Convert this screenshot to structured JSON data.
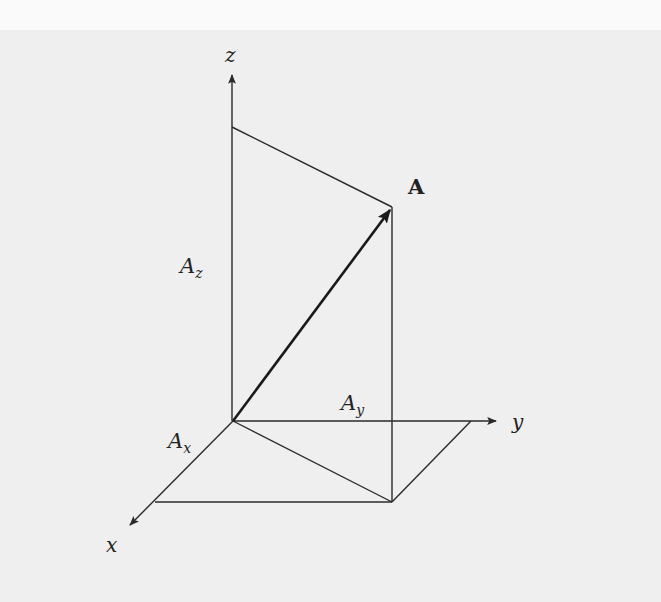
{
  "diagram": {
    "colors": {
      "background": "#efefef",
      "top_band": "#fafafa",
      "stroke": "#2a2a2a"
    },
    "axes": {
      "z": {
        "label": "z"
      },
      "y": {
        "label": "y"
      },
      "x": {
        "label": "x"
      }
    },
    "vector": {
      "label": "A"
    },
    "components": {
      "Az": {
        "base": "A",
        "sub": "z"
      },
      "Ay": {
        "base": "A",
        "sub": "y"
      },
      "Ax": {
        "base": "A",
        "sub": "x"
      }
    },
    "points": {
      "origin": [
        233,
        421
      ],
      "z_axis_tip": [
        232,
        73
      ],
      "y_axis_tip": [
        498,
        421
      ],
      "x_axis_tip": [
        128,
        527
      ],
      "z_projection": [
        232,
        127
      ],
      "vector_tip": [
        392,
        207
      ],
      "xy_projection": [
        392,
        502
      ],
      "x_corner": [
        155,
        502
      ],
      "y_corner": [
        471,
        421
      ]
    }
  }
}
